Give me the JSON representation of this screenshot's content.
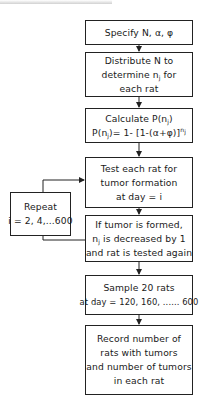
{
  "diagram": {
    "type": "flowchart",
    "header_partial": "(cropped header text, illegible)",
    "nodes": [
      {
        "id": "specify",
        "lines": [
          "Specify N, α, φ"
        ]
      },
      {
        "id": "distribute",
        "lines": [
          "Distribute N to",
          "determine n",
          "j",
          " for",
          "each rat"
        ]
      },
      {
        "id": "calculate",
        "lines": [
          "Calculate P(n",
          "j",
          ")",
          "P(n",
          "j",
          ")= 1- [1-(α+φ)]",
          "n",
          "j"
        ]
      },
      {
        "id": "test",
        "lines": [
          "Test each rat for",
          "tumor formation",
          "at day = i"
        ]
      },
      {
        "id": "repeat",
        "lines": [
          "Repeat",
          "i = 2, 4,...600"
        ]
      },
      {
        "id": "decrease",
        "lines": [
          "If tumor is formed,",
          "n",
          "j",
          " is decreased by 1",
          "and rat is tested again"
        ]
      },
      {
        "id": "sample",
        "lines": [
          "Sample 20 rats",
          "at day = 120, 160, ...... 600"
        ]
      },
      {
        "id": "record",
        "lines": [
          "Record number of",
          "rats with tumors",
          "and number of tumors",
          "in each rat"
        ]
      }
    ],
    "edges": [
      {
        "from": "specify",
        "to": "distribute"
      },
      {
        "from": "distribute",
        "to": "calculate"
      },
      {
        "from": "calculate",
        "to": "test"
      },
      {
        "from": "test",
        "to": "decrease"
      },
      {
        "from": "decrease",
        "to": "repeat",
        "note": "feedback loop"
      },
      {
        "from": "repeat",
        "to": "test",
        "note": "loop back"
      },
      {
        "from": "decrease",
        "to": "sample"
      },
      {
        "from": "sample",
        "to": "record"
      }
    ],
    "colors": {
      "line": "#222222",
      "background": "#ffffff",
      "text": "#1a1a1a"
    }
  }
}
